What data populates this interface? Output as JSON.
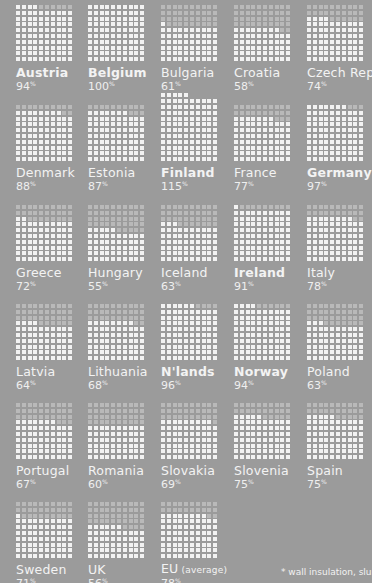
{
  "chart_data": {
    "type": "waffle",
    "title": "",
    "unit": "%",
    "grid_columns": 10,
    "dots_per_grid": 100,
    "countries": [
      {
        "name": "Austria",
        "value": 94,
        "bold": true
      },
      {
        "name": "Belgium",
        "value": 100,
        "bold": true
      },
      {
        "name": "Bulgaria",
        "value": 61,
        "bold": false
      },
      {
        "name": "Croatia",
        "value": 58,
        "bold": false
      },
      {
        "name": "Czech Rep.",
        "value": 74,
        "bold": false
      },
      {
        "name": "Denmark",
        "value": 88,
        "bold": false
      },
      {
        "name": "Estonia",
        "value": 87,
        "bold": false
      },
      {
        "name": "Finland",
        "value": 115,
        "bold": true
      },
      {
        "name": "France",
        "value": 77,
        "bold": false
      },
      {
        "name": "Germany",
        "value": 97,
        "bold": true
      },
      {
        "name": "Greece",
        "value": 72,
        "bold": false
      },
      {
        "name": "Hungary",
        "value": 55,
        "bold": false
      },
      {
        "name": "Iceland",
        "value": 63,
        "bold": false
      },
      {
        "name": "Ireland",
        "value": 91,
        "bold": true
      },
      {
        "name": "Italy",
        "value": 78,
        "bold": false
      },
      {
        "name": "Latvia",
        "value": 64,
        "bold": false
      },
      {
        "name": "Lithuania",
        "value": 68,
        "bold": false
      },
      {
        "name": "N'lands",
        "value": 96,
        "bold": true
      },
      {
        "name": "Norway",
        "value": 94,
        "bold": true
      },
      {
        "name": "Poland",
        "value": 63,
        "bold": false
      },
      {
        "name": "Portugal",
        "value": 67,
        "bold": false
      },
      {
        "name": "Romania",
        "value": 60,
        "bold": false
      },
      {
        "name": "Slovakia",
        "value": 69,
        "bold": false
      },
      {
        "name": "Slovenia",
        "value": 75,
        "bold": false
      },
      {
        "name": "Spain",
        "value": 75,
        "bold": false
      },
      {
        "name": "Sweden",
        "value": 71,
        "bold": false
      },
      {
        "name": "UK",
        "value": 56,
        "bold": false
      },
      {
        "name": "EU",
        "name_suffix": "(average)",
        "value": 78,
        "bold": false
      }
    ]
  },
  "footnote": "* wall insulation, slurry,",
  "colors": {
    "background": "#9b9b9b",
    "dot_filled": "#f2f2f2",
    "dot_empty": "#b9b9b9",
    "text": "#f3f3f3"
  }
}
